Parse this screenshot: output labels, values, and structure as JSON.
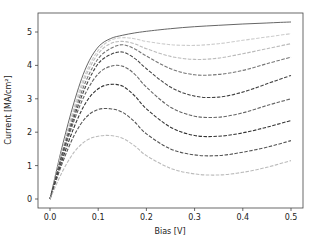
{
  "chart_data": {
    "type": "line",
    "title": "",
    "xlabel": "Bias [V]",
    "ylabel": "Current [MA/cm²]",
    "xlim": [
      -0.025,
      0.525
    ],
    "ylim": [
      -0.25,
      5.6
    ],
    "xticks": [
      "0.0",
      "0.1",
      "0.2",
      "0.3",
      "0.4",
      "0.5"
    ],
    "yticks": [
      "0",
      "1",
      "2",
      "3",
      "4",
      "5"
    ],
    "grid": false,
    "legend": null,
    "x": [
      0.0,
      0.025,
      0.05,
      0.075,
      0.1,
      0.125,
      0.15,
      0.175,
      0.2,
      0.25,
      0.3,
      0.35,
      0.4,
      0.45,
      0.5
    ],
    "series": [
      {
        "name": "curve-1",
        "style": "solid",
        "color": "#555555",
        "values": [
          0.0,
          1.55,
          2.9,
          3.95,
          4.55,
          4.8,
          4.9,
          4.97,
          5.02,
          5.1,
          5.16,
          5.2,
          5.24,
          5.27,
          5.3
        ]
      },
      {
        "name": "curve-2",
        "style": "dashed",
        "color": "#cccccc",
        "values": [
          0.0,
          1.45,
          2.75,
          3.8,
          4.45,
          4.75,
          4.83,
          4.8,
          4.72,
          4.62,
          4.6,
          4.65,
          4.75,
          4.85,
          4.95
        ]
      },
      {
        "name": "curve-3",
        "style": "dashed",
        "color": "#bbbbbb",
        "values": [
          0.0,
          1.4,
          2.65,
          3.7,
          4.35,
          4.65,
          4.72,
          4.65,
          4.5,
          4.27,
          4.18,
          4.22,
          4.35,
          4.5,
          4.65
        ]
      },
      {
        "name": "curve-4",
        "style": "dashed",
        "color": "#777777",
        "values": [
          0.0,
          1.35,
          2.55,
          3.55,
          4.2,
          4.5,
          4.62,
          4.5,
          4.28,
          3.9,
          3.72,
          3.73,
          3.85,
          4.05,
          4.25
        ]
      },
      {
        "name": "curve-5",
        "style": "dashed",
        "color": "#444444",
        "values": [
          0.0,
          1.3,
          2.45,
          3.4,
          4.05,
          4.32,
          4.4,
          4.22,
          3.9,
          3.35,
          3.08,
          3.05,
          3.2,
          3.45,
          3.7
        ]
      },
      {
        "name": "curve-6",
        "style": "dashed",
        "color": "#666666",
        "values": [
          0.0,
          1.25,
          2.35,
          3.2,
          3.75,
          3.97,
          3.98,
          3.75,
          3.35,
          2.75,
          2.48,
          2.45,
          2.58,
          2.8,
          3.0
        ]
      },
      {
        "name": "curve-7",
        "style": "dashed",
        "color": "#333333",
        "values": [
          0.0,
          1.15,
          2.15,
          2.9,
          3.3,
          3.43,
          3.38,
          3.1,
          2.7,
          2.15,
          1.9,
          1.88,
          1.98,
          2.15,
          2.35
        ]
      },
      {
        "name": "curve-8",
        "style": "dashed",
        "color": "#555555",
        "values": [
          0.0,
          1.05,
          1.9,
          2.45,
          2.68,
          2.7,
          2.6,
          2.32,
          1.95,
          1.5,
          1.32,
          1.3,
          1.4,
          1.55,
          1.75
        ]
      },
      {
        "name": "curve-9",
        "style": "dashed",
        "color": "#bbbbbb",
        "values": [
          0.0,
          0.8,
          1.4,
          1.75,
          1.88,
          1.9,
          1.82,
          1.6,
          1.3,
          0.92,
          0.75,
          0.72,
          0.8,
          0.95,
          1.15
        ]
      }
    ]
  },
  "layout": {
    "plot_left": 38,
    "plot_right": 303,
    "plot_top": 13,
    "plot_bottom": 208,
    "x0_px": 50,
    "x_per_unit": 482,
    "y0_px": 199,
    "y_per_unit": 33.4
  }
}
